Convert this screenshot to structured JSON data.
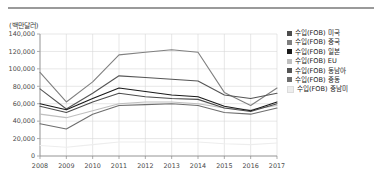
{
  "decor": {
    "top_rule": "horizontal-rule"
  },
  "chart_data": {
    "type": "line",
    "title": "",
    "subtitle": "",
    "unit_label": "(백만달러)",
    "xlabel": "",
    "ylabel": "",
    "x": [
      2008,
      2009,
      2010,
      2011,
      2012,
      2013,
      2014,
      2015,
      2016,
      2017
    ],
    "categories": [
      "2008",
      "2009",
      "2010",
      "2011",
      "2012",
      "2013",
      "2014",
      "2015",
      "2016",
      "2017"
    ],
    "ylim": [
      0,
      140000
    ],
    "yticks": [
      0,
      20000,
      40000,
      60000,
      80000,
      100000,
      120000,
      140000
    ],
    "ytick_labels": [
      "0",
      "20,000",
      "40,000",
      "60,000",
      "80,000",
      "100,000",
      "120,000",
      "140,000"
    ],
    "grid": true,
    "legend_position": "right",
    "series": [
      {
        "name": "수입(FOB) 미국",
        "color": "#4d4d4d",
        "values": [
          57000,
          50000,
          62000,
          72000,
          68000,
          66000,
          65000,
          55000,
          51000,
          60000
        ]
      },
      {
        "name": "수입(FOB) 중국",
        "color": "#808080",
        "values": [
          96000,
          62000,
          85000,
          116000,
          119000,
          122000,
          119000,
          73000,
          58000,
          78000
        ]
      },
      {
        "name": "수입(FOB) 일본",
        "color": "#1a1a1a",
        "values": [
          60000,
          53000,
          66000,
          78000,
          74000,
          70000,
          68000,
          57000,
          52000,
          62000
        ]
      },
      {
        "name": "수입(FOB) EU",
        "color": "#bfbfbf",
        "values": [
          48000,
          44000,
          52000,
          60000,
          62000,
          62000,
          60000,
          55000,
          53000,
          58000
        ]
      },
      {
        "name": "수입(FOB) 동남아",
        "color": "#555555",
        "values": [
          77000,
          54000,
          72000,
          92000,
          90000,
          88000,
          86000,
          70000,
          66000,
          72000
        ]
      },
      {
        "name": "수입(FOB) 중동",
        "color": "#6e6e6e",
        "values": [
          37000,
          31000,
          48000,
          58000,
          59000,
          60000,
          58000,
          50000,
          48000,
          55000
        ]
      },
      {
        "name": "수입(FOB) 중남미",
        "color": "#ededed",
        "values": [
          12000,
          10000,
          13000,
          16000,
          16000,
          16000,
          16000,
          14000,
          13000,
          15000
        ]
      }
    ]
  }
}
